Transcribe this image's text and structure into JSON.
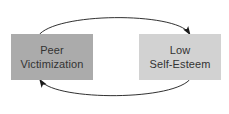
{
  "diagram": {
    "type": "cycle-diagram",
    "background_color": "#ffffff",
    "nodes": [
      {
        "id": "peer-victimization",
        "line1": "Peer",
        "line2": "Victimization",
        "fill_color": "#ababab",
        "text_color": "#333333"
      },
      {
        "id": "low-self-esteem",
        "line1": "Low",
        "line2": "Self-Esteem",
        "fill_color": "#d2d2d2",
        "text_color": "#333333"
      }
    ],
    "arrows": [
      {
        "id": "top-arrow",
        "from": "peer-victimization",
        "to": "low-self-esteem",
        "direction": "left-to-right",
        "style": "curved-arc-above",
        "stroke_color": "#1a1a1a"
      },
      {
        "id": "bottom-arrow",
        "from": "low-self-esteem",
        "to": "peer-victimization",
        "direction": "right-to-left",
        "style": "curved-arc-below",
        "stroke_color": "#1a1a1a"
      }
    ]
  }
}
